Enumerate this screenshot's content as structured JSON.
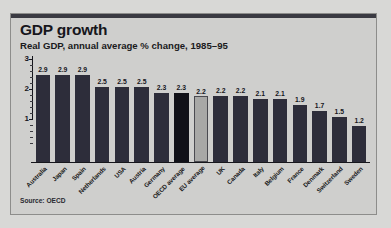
{
  "panel": {
    "title": "GDP growth",
    "subtitle": "Real GDP, annual average % change, 1985–95",
    "source": "Source: OECD"
  },
  "colors": {
    "page_background": "#d8d8d6",
    "panel_background": "#cfcfcd",
    "panel_topbar": "#3a3a42",
    "bar_normal": "#2d2d3a",
    "bar_oecd_average": "#111118",
    "bar_eu_average": "#a8a8a6",
    "axis": "#16161c",
    "text": "#16161c"
  },
  "chart_data": {
    "type": "bar",
    "title": "GDP growth",
    "subtitle": "Real GDP, annual average % change, 1985–95",
    "xlabel": "",
    "ylabel": "",
    "ylim": [
      0,
      3
    ],
    "yticks": [
      0,
      1,
      2,
      3
    ],
    "ytick_labels": [
      "",
      "1",
      "2",
      "3"
    ],
    "minor_ticks": true,
    "grid": false,
    "legend": false,
    "source": "Source: OECD",
    "categories": [
      "Australia",
      "Japan",
      "Spain",
      "Netherlands",
      "USA",
      "Austria",
      "Germany",
      "OECD average",
      "EU average",
      "UK",
      "Canada",
      "Italy",
      "Belgium",
      "France",
      "Denmark",
      "Switzerland",
      "Sweden"
    ],
    "values": [
      2.9,
      2.9,
      2.9,
      2.5,
      2.5,
      2.5,
      2.3,
      2.3,
      2.2,
      2.2,
      2.2,
      2.1,
      2.1,
      1.9,
      1.7,
      1.5,
      1.2
    ],
    "value_labels": [
      "2.9",
      "2.9",
      "2.9",
      "2.5",
      "2.5",
      "2.5",
      "2.3",
      "2.3",
      "2.2",
      "2.2",
      "2.2",
      "2.1",
      "2.1",
      "1.9",
      "1.7",
      "1.5",
      "1.2"
    ],
    "bar_styles": [
      "normal",
      "normal",
      "normal",
      "normal",
      "normal",
      "normal",
      "normal",
      "oecd",
      "eu",
      "normal",
      "normal",
      "normal",
      "normal",
      "normal",
      "normal",
      "normal",
      "normal"
    ]
  }
}
